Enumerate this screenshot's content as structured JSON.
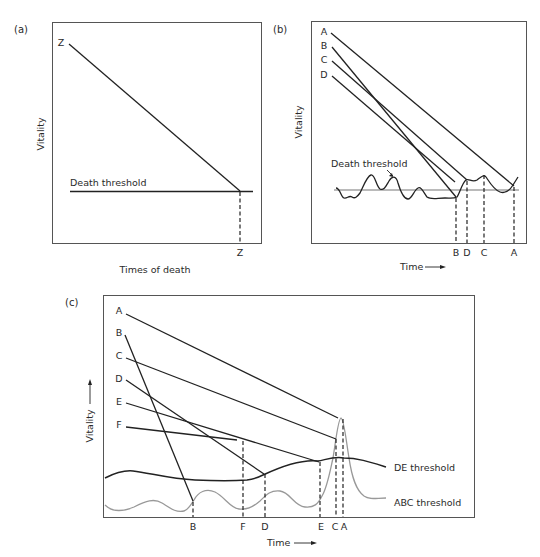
{
  "header": {
    "cutoff_text": "... vitality ... death ..."
  },
  "panels": {
    "a": {
      "label": "(a)",
      "y_axis_label": "Vitality",
      "x_axis_label": "Times of death",
      "threshold_label": "Death threshold",
      "lines": [
        {
          "name": "Z",
          "start_label": "Z",
          "end_label": "Z"
        }
      ]
    },
    "b": {
      "label": "(b)",
      "y_axis_label": "Vitality",
      "x_axis_label": "Time",
      "x_axis_arrow": "⟶",
      "threshold_label": "Death threshold",
      "lines": [
        {
          "name": "A",
          "start_label": "A",
          "end_label": "A"
        },
        {
          "name": "B",
          "start_label": "B",
          "end_label": "B"
        },
        {
          "name": "C",
          "start_label": "C",
          "end_label": "C"
        },
        {
          "name": "D",
          "start_label": "D",
          "end_label": "D"
        }
      ],
      "death_order": [
        "B",
        "D",
        "C",
        "A"
      ]
    },
    "c": {
      "label": "(c)",
      "y_axis_label": "Vitality",
      "y_axis_arrow": "⟶",
      "x_axis_label": "Time",
      "x_axis_arrow": "⟶",
      "thresholds": [
        {
          "name": "DE threshold",
          "label": "DE threshold",
          "color": "#222222"
        },
        {
          "name": "ABC threshold",
          "label": "ABC threshold",
          "color": "#999999"
        }
      ],
      "lines": [
        {
          "name": "A",
          "start_label": "A",
          "end_label": "A"
        },
        {
          "name": "B",
          "start_label": "B",
          "end_label": "B"
        },
        {
          "name": "C",
          "start_label": "C",
          "end_label": "C"
        },
        {
          "name": "D",
          "start_label": "D",
          "end_label": "D"
        },
        {
          "name": "E",
          "start_label": "E",
          "end_label": "E"
        },
        {
          "name": "F",
          "start_label": "F",
          "end_label": "F"
        }
      ],
      "death_order": [
        "B",
        "F",
        "D",
        "E",
        "C",
        "A"
      ]
    }
  }
}
